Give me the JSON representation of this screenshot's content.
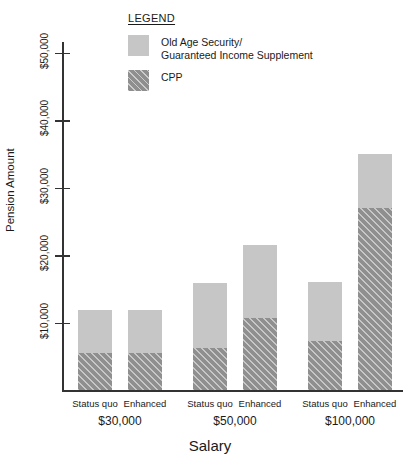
{
  "legend": {
    "title": "LEGEND",
    "items": [
      {
        "label": "Old Age Security/\nGuaranteed Income Supplement",
        "swatch": "light-gray-solid",
        "color": "#c6c6c6"
      },
      {
        "label": "CPP",
        "swatch": "gray-diagonal-hatch",
        "color": "#8f8f8f"
      }
    ]
  },
  "chart_data": {
    "type": "bar",
    "title": "",
    "xlabel": "Salary",
    "ylabel": "Pension Amount",
    "ylim": [
      0,
      52000
    ],
    "yticks": [
      10000,
      20000,
      30000,
      40000,
      50000
    ],
    "ytick_labels": [
      "$10,000",
      "$20,000",
      "$30,000",
      "$40,000",
      "$50,000"
    ],
    "grid": false,
    "stacked": true,
    "legend_position": "top-center",
    "groups": [
      "$30,000",
      "$50,000",
      "$100,000"
    ],
    "categories": [
      "Status quo",
      "Enhanced",
      "Status quo",
      "Enhanced",
      "Status quo",
      "Enhanced"
    ],
    "series": [
      {
        "name": "CPP",
        "color": "#8f8f8f",
        "values": [
          5500,
          5500,
          6200,
          10700,
          7300,
          27000
        ]
      },
      {
        "name": "Old Age Security/Guaranteed Income Supplement",
        "color": "#c6c6c6",
        "values": [
          6400,
          6400,
          9700,
          10800,
          8700,
          8000
        ]
      }
    ],
    "totals": [
      11900,
      11900,
      15900,
      21500,
      16000,
      35000
    ]
  }
}
